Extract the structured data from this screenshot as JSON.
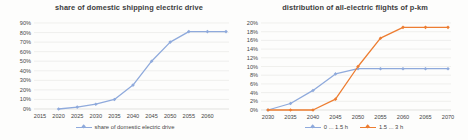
{
  "chart_data": [
    {
      "type": "line",
      "title": "share of domestic shipping electric drive",
      "xlabel": "",
      "ylabel": "",
      "ylim": [
        0,
        90
      ],
      "ytick_step": 10,
      "ytick_suffix": "%",
      "grid": true,
      "legend_position": "bottom",
      "x_ticks": [
        2015,
        2020,
        2025,
        2030,
        2035,
        2040,
        2045,
        2050,
        2055,
        2060
      ],
      "xrange": [
        2015,
        2065
      ],
      "series": [
        {
          "name": "share of domestic electric drive",
          "color": "#8FAADC",
          "x": [
            2020,
            2025,
            2030,
            2035,
            2040,
            2045,
            2050,
            2055,
            2060,
            2065
          ],
          "values": [
            0,
            2,
            5,
            10,
            25,
            50,
            70,
            81,
            81,
            81
          ]
        }
      ]
    },
    {
      "type": "line",
      "title": "distribution of all-electric flights of p-km",
      "xlabel": "",
      "ylabel": "",
      "ylim": [
        0,
        20
      ],
      "ytick_step": 2,
      "ytick_suffix": "%",
      "grid": true,
      "legend_position": "bottom",
      "x_ticks": [
        2030,
        2035,
        2040,
        2045,
        2050,
        2055,
        2060,
        2065,
        2070
      ],
      "xrange": [
        2030,
        2070
      ],
      "series": [
        {
          "name": "0 ... 1.5 h",
          "color": "#8FAADC",
          "x": [
            2030,
            2035,
            2040,
            2045,
            2050,
            2055,
            2060,
            2065,
            2070
          ],
          "values": [
            0,
            1.5,
            4.5,
            8.3,
            9.5,
            9.5,
            9.5,
            9.5,
            9.5
          ]
        },
        {
          "name": "1.5 ... 3 h",
          "color": "#ED7D31",
          "x": [
            2030,
            2035,
            2040,
            2045,
            2050,
            2055,
            2060,
            2065,
            2070
          ],
          "values": [
            0,
            0,
            0,
            2.5,
            10,
            16.5,
            19,
            19,
            19
          ]
        }
      ]
    }
  ],
  "colors": {
    "grid": "#e9e9e6",
    "axis": "#d6d6d3",
    "tick_text": "#464646",
    "title_text": "#3c3c3c"
  }
}
